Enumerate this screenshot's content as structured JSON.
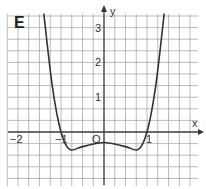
{
  "figure": {
    "label": "E",
    "axis_x_label": "x",
    "axis_y_label": "y",
    "origin_label": "O",
    "x_tick_labels": [
      "−2",
      "−1",
      "1"
    ],
    "y_tick_labels": [
      "1",
      "2",
      "3"
    ],
    "colors": {
      "grid": "#9a9a9a",
      "axis": "#444444",
      "curve": "#333333"
    }
  },
  "chart_data": {
    "type": "line",
    "title": "E",
    "xlabel": "x",
    "ylabel": "y",
    "xlim": [
      -2.3,
      2.3
    ],
    "ylim": [
      -1.3,
      3.3
    ],
    "grid": true,
    "series": [
      {
        "name": "f(x)",
        "x": [
          -1.4,
          -1.2,
          -1.0,
          -0.8,
          -0.5,
          0,
          0.5,
          0.8,
          1.0,
          1.2,
          1.4
        ],
        "values": [
          3.4,
          1.3,
          0,
          -0.5,
          -0.42,
          -0.3,
          -0.42,
          -0.5,
          0,
          1.3,
          3.4
        ]
      }
    ]
  }
}
